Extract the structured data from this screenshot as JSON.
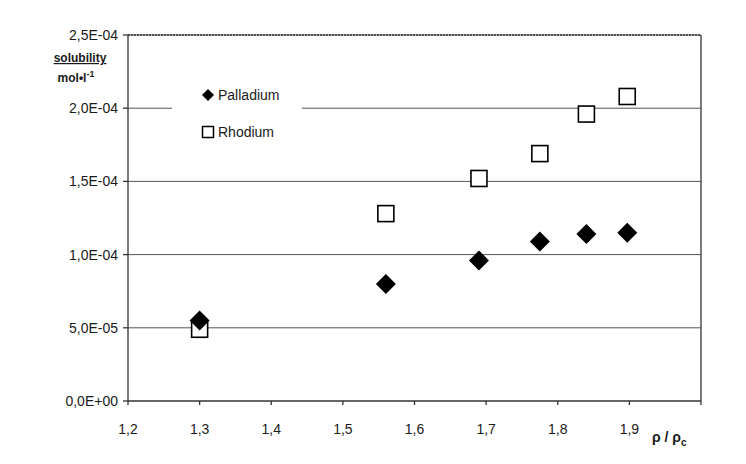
{
  "chart_data": {
    "type": "scatter",
    "title": "",
    "xlabel": "ρ / ρc",
    "ylabel": "solubility mol•l⁻¹",
    "ylabel_line1": "solubility",
    "ylabel_line2": "mol•l",
    "ylabel_sup": "-1",
    "xlabel_main": "ρ / ρ",
    "xlabel_sub": "c",
    "xlim": [
      1.2,
      2.0
    ],
    "ylim": [
      0,
      0.00025
    ],
    "x_ticks": [
      "1,2",
      "1,3",
      "1,4",
      "1,5",
      "1,6",
      "1,7",
      "1,8",
      "1,9"
    ],
    "x_tick_values": [
      1.2,
      1.3,
      1.4,
      1.5,
      1.6,
      1.7,
      1.8,
      1.9
    ],
    "y_ticks": [
      "0,0E+00",
      "5,0E-05",
      "1,0E-04",
      "1,5E-04",
      "2,0E-04",
      "2,5E-04"
    ],
    "y_tick_values": [
      0,
      5e-05,
      0.0001,
      0.00015,
      0.0002,
      0.00025
    ],
    "grid": "horizontal",
    "legend_position": "upper-left inside",
    "series": [
      {
        "name": "Palladium",
        "marker": "filled-diamond",
        "color": "#000000",
        "x": [
          1.3,
          1.56,
          1.69,
          1.775,
          1.84,
          1.897
        ],
        "y": [
          5.5e-05,
          8e-05,
          9.6e-05,
          0.000109,
          0.000114,
          0.000115
        ]
      },
      {
        "name": "Rhodium",
        "marker": "open-square",
        "color": "#000000",
        "x": [
          1.3,
          1.56,
          1.69,
          1.775,
          1.84,
          1.897
        ],
        "y": [
          4.9e-05,
          0.000128,
          0.000152,
          0.000169,
          0.000196,
          0.000208
        ]
      }
    ]
  },
  "legend": {
    "items": [
      {
        "label": "Palladium",
        "marker": "filled-diamond"
      },
      {
        "label": "Rhodium",
        "marker": "open-square"
      }
    ]
  }
}
